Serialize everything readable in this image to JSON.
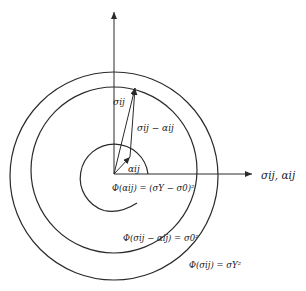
{
  "diagram": {
    "axes": {
      "horizontal_label": "σij, αij"
    },
    "vectors": {
      "sigma": "σij",
      "sigma_minus_alpha": "σij − αij",
      "alpha": "αij"
    },
    "surfaces": {
      "inner": "Φ(αij) = (σY − σ0)²",
      "middle": "Φ(σij − αij) = σ0²",
      "outer": "Φ(σij) = σY²"
    },
    "colors": {
      "line": "#2a2a2a",
      "background": "#ffffff"
    }
  }
}
